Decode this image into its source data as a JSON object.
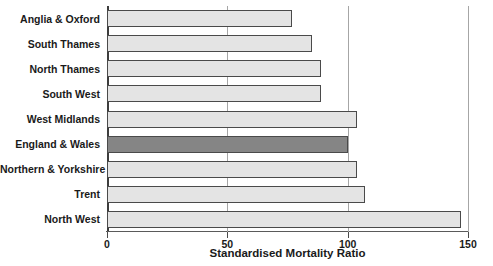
{
  "chart_data": {
    "type": "bar",
    "orientation": "horizontal",
    "title": "",
    "xlabel": "Standardised Mortality Ratio",
    "ylabel": "",
    "xlim": [
      0,
      150
    ],
    "xticks": [
      0,
      50,
      100,
      150
    ],
    "xtick_labels": [
      "0",
      "50",
      "100",
      "150"
    ],
    "grid": true,
    "legend": "none",
    "categories": [
      "Anglia & Oxford",
      "South Thames",
      "North Thames",
      "South West",
      "West Midlands",
      "England & Wales",
      "Northern & Yorkshire",
      "Trent",
      "North West"
    ],
    "values": [
      77,
      85,
      89,
      89,
      104,
      100,
      104,
      107,
      147
    ],
    "highlight_category": "England & Wales",
    "colors": {
      "bar_fill": "#e4e4e4",
      "bar_stroke": "#4a4a4a",
      "highlight_fill": "#858585",
      "gridline": "#a6a6a6",
      "axis": "#3d3d3d",
      "text": "#1a1a1a",
      "background": "#ffffff"
    }
  }
}
